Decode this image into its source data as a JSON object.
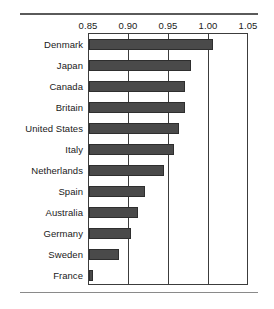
{
  "chart_data": {
    "type": "bar",
    "orientation": "horizontal",
    "title": "",
    "subtitle": "",
    "xlabel": "",
    "ylabel": "",
    "xlim": [
      0.85,
      1.05
    ],
    "xticks": [
      "0.85",
      "0.90",
      "0.95",
      "1.00",
      "1.05"
    ],
    "xtick_values": [
      0.85,
      0.9,
      0.95,
      1.0,
      1.05
    ],
    "grid": "vertical",
    "legend": "none",
    "bar_color": "#4a4a4a",
    "categories": [
      "Denmark",
      "Japan",
      "Canada",
      "Britain",
      "United States",
      "Italy",
      "Netherlands",
      "Spain",
      "Australia",
      "Germany",
      "Sweden",
      "France"
    ],
    "values": [
      1.005,
      0.978,
      0.97,
      0.97,
      0.962,
      0.956,
      0.944,
      0.92,
      0.911,
      0.903,
      0.888,
      0.855
    ]
  },
  "axis": {
    "ticks": [
      "0.85",
      "0.90",
      "0.95",
      "1.00",
      "1.05"
    ]
  },
  "rows": [
    {
      "label": "Denmark",
      "value": 1.005
    },
    {
      "label": "Japan",
      "value": 0.978
    },
    {
      "label": "Canada",
      "value": 0.97
    },
    {
      "label": "Britain",
      "value": 0.97
    },
    {
      "label": "United States",
      "value": 0.962
    },
    {
      "label": "Italy",
      "value": 0.956
    },
    {
      "label": "Netherlands",
      "value": 0.944
    },
    {
      "label": "Spain",
      "value": 0.92
    },
    {
      "label": "Australia",
      "value": 0.911
    },
    {
      "label": "Germany",
      "value": 0.903
    },
    {
      "label": "Sweden",
      "value": 0.888
    },
    {
      "label": "France",
      "value": 0.855
    }
  ]
}
